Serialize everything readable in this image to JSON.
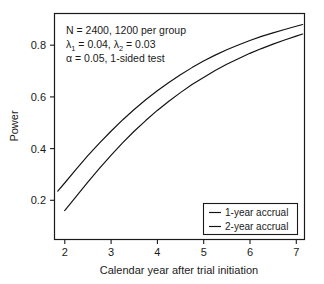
{
  "chart_data": {
    "type": "line",
    "title": "",
    "xlabel": "Calendar year after trial initiation",
    "ylabel": "Power",
    "xlim": [
      1.78,
      7.18
    ],
    "ylim": [
      0.155,
      0.915
    ],
    "xticks": [
      2,
      3,
      4,
      5,
      6,
      7
    ],
    "xtick_labels": [
      "2",
      "3",
      "4",
      "5",
      "6",
      "7"
    ],
    "yticks": [
      0.2,
      0.4,
      0.6,
      0.8
    ],
    "ytick_labels": [
      "0.2",
      "0.4",
      "0.6",
      "0.8"
    ],
    "grid": false,
    "legend_position": "bottom-right",
    "series": [
      {
        "name": "1-year accrual",
        "x": [
          1.85,
          2.0,
          2.25,
          2.5,
          2.75,
          3.0,
          3.25,
          3.5,
          3.75,
          4.0,
          4.25,
          4.5,
          4.75,
          5.0,
          5.25,
          5.5,
          5.75,
          6.0,
          6.25,
          6.5,
          6.75,
          7.0,
          7.14
        ],
        "values": [
          0.318,
          0.345,
          0.392,
          0.437,
          0.479,
          0.519,
          0.557,
          0.592,
          0.625,
          0.655,
          0.683,
          0.709,
          0.733,
          0.755,
          0.775,
          0.793,
          0.809,
          0.824,
          0.838,
          0.85,
          0.861,
          0.872,
          0.878
        ]
      },
      {
        "name": "2-year accrual",
        "x": [
          2.0,
          2.25,
          2.5,
          2.75,
          3.0,
          3.25,
          3.5,
          3.75,
          4.0,
          4.25,
          4.5,
          4.75,
          5.0,
          5.25,
          5.5,
          5.75,
          6.0,
          6.25,
          6.5,
          6.75,
          7.0,
          7.14
        ],
        "values": [
          0.252,
          0.3,
          0.348,
          0.394,
          0.438,
          0.48,
          0.519,
          0.555,
          0.589,
          0.62,
          0.649,
          0.676,
          0.7,
          0.723,
          0.744,
          0.763,
          0.781,
          0.797,
          0.812,
          0.826,
          0.839,
          0.846
        ]
      }
    ],
    "annotations": [
      {
        "id": "sample-size",
        "text": "N = 2400, 1200 per group"
      },
      {
        "id": "hazard-rates",
        "segments": [
          {
            "text": "λ",
            "type": "normal"
          },
          {
            "text": "1",
            "type": "sub"
          },
          {
            "text": " = 0.04, ",
            "type": "normal"
          },
          {
            "text": "λ",
            "type": "normal"
          },
          {
            "text": "2",
            "type": "sub"
          },
          {
            "text": " = 0.03",
            "type": "normal"
          }
        ],
        "plain": "λ1 = 0.04, λ2 = 0.03"
      },
      {
        "id": "alpha-level",
        "text": "α = 0.05, 1-sided test"
      }
    ],
    "legend_entries": [
      "1-year accrual",
      "2-year accrual"
    ],
    "colors": {
      "curve": "#111111",
      "axis": "#1a1a1a",
      "background": "#ffffff"
    }
  }
}
